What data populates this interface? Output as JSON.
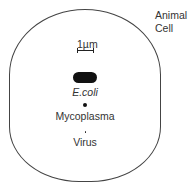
{
  "diagram": {
    "cell_label_line1": "Animal",
    "cell_label_line2": "Cell",
    "scale_label": "1µm",
    "items": [
      {
        "name": "E.coli",
        "shape": "rod"
      },
      {
        "name": "Mycoplasma",
        "shape": "dot"
      },
      {
        "name": "Virus",
        "shape": "tiny-dot"
      }
    ]
  }
}
